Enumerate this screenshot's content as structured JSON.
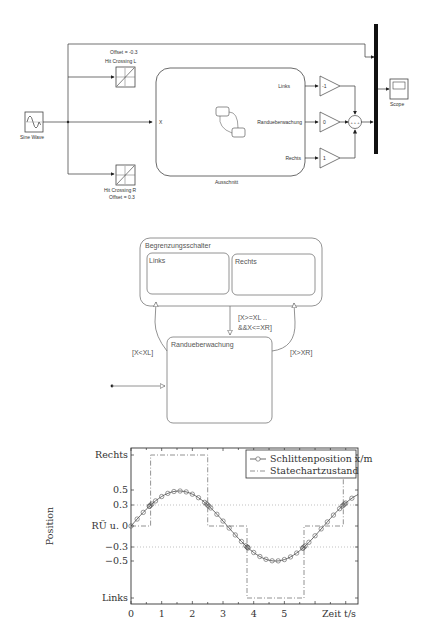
{
  "simulink": {
    "sine_wave": {
      "label": "Sine Wave"
    },
    "hit_crossing_l": {
      "label": "Hit Crossing L",
      "param": "Offset = -0.3"
    },
    "hit_crossing_r": {
      "label": "Hit Crossing R",
      "param": "Offset = 0.3"
    },
    "chart_block": {
      "label": "Ausschnitt",
      "input_port": "X",
      "output_ports": [
        "Links",
        "Randueberwachung",
        "Rechts"
      ]
    },
    "gains": [
      "-1",
      "0",
      "1"
    ],
    "sum_signs": "+ + +",
    "scope": {
      "label": "Scope"
    }
  },
  "stateflow": {
    "superstate": {
      "label": "Begrenzungsschalter"
    },
    "states": [
      {
        "label": "Links"
      },
      {
        "label": "Rechts"
      }
    ],
    "monitor_state": {
      "label": "Randueberwachung"
    },
    "transitions": {
      "to_links": "[X<XL]",
      "to_rechts": "[X>XR]",
      "return_line1": "[X>=XL ..",
      "return_line2": "&&X<=XR]"
    }
  },
  "chart_data": {
    "type": "line",
    "title": "",
    "xlabel": "Zeit t/s",
    "ylabel": "Position",
    "xlim": [
      0,
      7.4
    ],
    "ylim": [
      -1.1,
      1.1
    ],
    "x_ticks": [
      "0",
      "1",
      "2",
      "3",
      "4",
      "5"
    ],
    "y_ticks": [
      {
        "value": 1.0,
        "label": "Rechts"
      },
      {
        "value": 0.5,
        "label": "0.5"
      },
      {
        "value": 0.3,
        "label": "0.3"
      },
      {
        "value": 0.0,
        "label": "RÜ u. 0"
      },
      {
        "value": -0.3,
        "label": "−0.3"
      },
      {
        "value": -0.5,
        "label": "−0.5"
      },
      {
        "value": -1.0,
        "label": "Links"
      }
    ],
    "grid": "dotted at ±0.3",
    "legend_position": "upper right",
    "series": [
      {
        "name": "Schlittenposition x/m",
        "style": "solid line with circle markers",
        "function": "0.5*sin(t)",
        "x": [
          0,
          0.64,
          1.57,
          2.5,
          3.14,
          3.78,
          4.71,
          5.64,
          6.28,
          6.92,
          7.4
        ],
        "values": [
          0,
          0.3,
          0.5,
          0.3,
          0,
          -0.3,
          -0.5,
          -0.3,
          0,
          0.3,
          0.45
        ]
      },
      {
        "name": "Statechartzustand",
        "style": "dash-dot",
        "x": [
          0,
          0.64,
          0.64,
          2.5,
          2.5,
          3.78,
          3.78,
          5.64,
          5.64,
          6.92,
          6.92,
          7.4
        ],
        "values": [
          0,
          0,
          1,
          1,
          0,
          0,
          -1,
          -1,
          0,
          0,
          1,
          1
        ]
      }
    ]
  }
}
